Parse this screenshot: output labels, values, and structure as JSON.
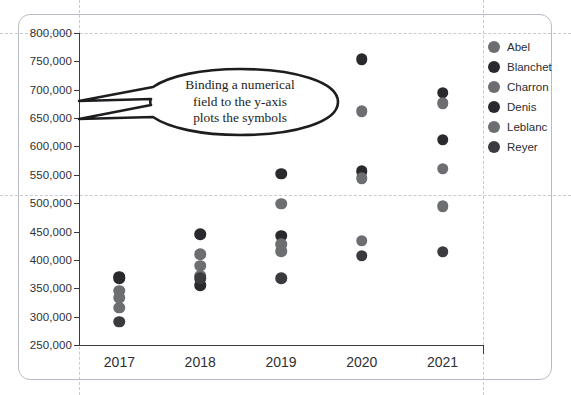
{
  "chart_data": {
    "type": "scatter",
    "title": "",
    "xlabel": "",
    "ylabel": "",
    "categories": [
      "2017",
      "2018",
      "2019",
      "2020",
      "2021"
    ],
    "ylim": [
      250000,
      800000
    ],
    "ytick_step": 50000,
    "ytick_labels": [
      "800,000",
      "750,000",
      "700,000",
      "650,000",
      "600,000",
      "550,000",
      "500,000",
      "450,000",
      "400,000",
      "350,000",
      "300,000",
      "250,000"
    ],
    "ytick_values": [
      800000,
      750000,
      700000,
      650000,
      600000,
      550000,
      500000,
      450000,
      400000,
      350000,
      300000,
      250000
    ],
    "grid": "dashed-canvas-guides",
    "legend_position": "right",
    "series": [
      {
        "name": "Abel",
        "color": "#6d6e72",
        "points": [
          {
            "x": "2017",
            "y": 346000
          },
          {
            "x": "2018",
            "y": 410000
          },
          {
            "x": "2019",
            "y": 499000
          },
          {
            "x": "2020",
            "y": 662000
          },
          {
            "x": "2021",
            "y": 495000
          }
        ]
      },
      {
        "name": "Blanchet",
        "color": "#2a2a2e",
        "points": [
          {
            "x": "2017",
            "y": 368000
          },
          {
            "x": "2018",
            "y": 445000
          },
          {
            "x": "2019",
            "y": 552000
          },
          {
            "x": "2020",
            "y": 754000
          },
          {
            "x": "2021",
            "y": 695000
          }
        ]
      },
      {
        "name": "Charron",
        "color": "#6d6e72",
        "points": [
          {
            "x": "2017",
            "y": 333000
          },
          {
            "x": "2018",
            "y": 390000
          },
          {
            "x": "2019",
            "y": 415000
          },
          {
            "x": "2020",
            "y": 434000
          },
          {
            "x": "2021",
            "y": 676000
          }
        ]
      },
      {
        "name": "Denis",
        "color": "#2a2a2e",
        "points": [
          {
            "x": "2017",
            "y": 370000
          },
          {
            "x": "2018",
            "y": 355000
          },
          {
            "x": "2019",
            "y": 443000
          },
          {
            "x": "2020",
            "y": 556000
          },
          {
            "x": "2021",
            "y": 612000
          }
        ]
      },
      {
        "name": "Leblanc",
        "color": "#6d6e72",
        "points": [
          {
            "x": "2017",
            "y": 316000
          },
          {
            "x": "2018",
            "y": 372000
          },
          {
            "x": "2019",
            "y": 428000
          },
          {
            "x": "2020",
            "y": 544000
          },
          {
            "x": "2021",
            "y": 561000
          }
        ]
      },
      {
        "name": "Reyer",
        "color": "#3a3a3f",
        "points": [
          {
            "x": "2017",
            "y": 291000
          },
          {
            "x": "2018",
            "y": 368000
          },
          {
            "x": "2019",
            "y": 368000
          },
          {
            "x": "2020",
            "y": 407000
          },
          {
            "x": "2021",
            "y": 414000
          }
        ]
      }
    ]
  },
  "callout": {
    "line1": "Binding a numerical",
    "line2": "field to the y-axis",
    "line3": "plots the symbols"
  },
  "legend": {
    "items": [
      {
        "label": "Abel",
        "color": "#6d6e72"
      },
      {
        "label": "Blanchet",
        "color": "#2a2a2e"
      },
      {
        "label": "Charron",
        "color": "#6d6e72"
      },
      {
        "label": "Denis",
        "color": "#2a2a2e"
      },
      {
        "label": "Leblanc",
        "color": "#6d6e72"
      },
      {
        "label": "Reyer",
        "color": "#3a3a3f"
      }
    ]
  },
  "colors": {
    "axis": "#3b3b3f",
    "guide": "#c9c9d2",
    "frame": "#b9bcc4",
    "text": "#2f3034",
    "callout_stroke": "#1d1d20"
  }
}
